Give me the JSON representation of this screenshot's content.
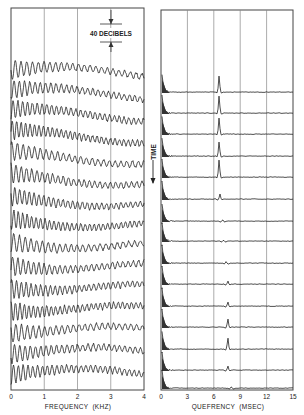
{
  "chart_data": [
    {
      "type": "line",
      "panel": "left",
      "title": "",
      "xlabel": "FREQUENCY (KHZ)",
      "ylabel": "",
      "xlim": [
        0,
        4
      ],
      "xticks": [
        "0",
        "1",
        "2",
        "3",
        "4"
      ],
      "grid": "vertical",
      "scale_annotation": "40 DECIBELS",
      "n_traces": 15,
      "description": "Stacked log-magnitude spectra of successive speech segments; each trace shows harmonic ripple at low frequencies decaying toward higher frequencies."
    },
    {
      "type": "line",
      "panel": "right",
      "title": "",
      "xlabel": "QUEFRENCY (MSEC)",
      "ylabel": "",
      "xlim": [
        0,
        15
      ],
      "xticks": [
        "0",
        "3",
        "6",
        "9",
        "12",
        "15"
      ],
      "grid": "vertical",
      "n_traces": 15,
      "series": [
        {
          "name": "trace 1",
          "peak_quefrency_ms": 6.6,
          "peak_height": 0.85
        },
        {
          "name": "trace 2",
          "peak_quefrency_ms": 6.6,
          "peak_height": 0.9
        },
        {
          "name": "trace 3",
          "peak_quefrency_ms": 6.6,
          "peak_height": 0.85
        },
        {
          "name": "trace 4",
          "peak_quefrency_ms": 6.6,
          "peak_height": 0.75
        },
        {
          "name": "trace 5",
          "peak_quefrency_ms": 6.6,
          "peak_height": 0.9
        },
        {
          "name": "trace 6",
          "peak_quefrency_ms": 6.7,
          "peak_height": 0.3
        },
        {
          "name": "trace 7",
          "peak_quefrency_ms": 7.0,
          "peak_height": 0.12
        },
        {
          "name": "trace 8",
          "peak_quefrency_ms": 7.1,
          "peak_height": 0.1
        },
        {
          "name": "trace 9",
          "peak_quefrency_ms": 7.4,
          "peak_height": 0.12
        },
        {
          "name": "trace 10",
          "peak_quefrency_ms": 7.6,
          "peak_height": 0.2
        },
        {
          "name": "trace 11",
          "peak_quefrency_ms": 7.6,
          "peak_height": 0.25
        },
        {
          "name": "trace 12",
          "peak_quefrency_ms": 7.6,
          "peak_height": 0.45
        },
        {
          "name": "trace 13",
          "peak_quefrency_ms": 7.6,
          "peak_height": 0.6
        },
        {
          "name": "trace 14",
          "peak_quefrency_ms": 7.6,
          "peak_height": 0.25
        },
        {
          "name": "trace 15",
          "peak_quefrency_ms": 8.0,
          "peak_height": 0.12
        }
      ]
    }
  ],
  "labels": {
    "decibel_scale": "40 DECIBELS",
    "time_axis": "TIME",
    "left_xlabel": "FREQUENCY  (KHZ)",
    "right_xlabel": "QUEFRENCY  (MSEC)",
    "left_ticks": [
      "0",
      "1",
      "2",
      "3",
      "4"
    ],
    "right_ticks": [
      "0",
      "3",
      "6",
      "9",
      "12",
      "15"
    ]
  }
}
